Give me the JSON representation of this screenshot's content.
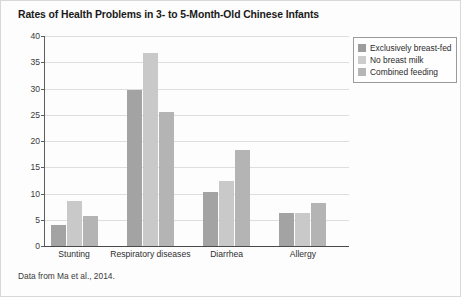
{
  "figure": {
    "title": "Rates of Health Problems in 3- to 5-Month-Old Chinese Infants",
    "source_note": "Data from Ma et al., 2014."
  },
  "chart_data": {
    "type": "bar",
    "title": "Rates of Health Problems in 3- to 5-Month-Old Chinese Infants",
    "xlabel": "",
    "ylabel": "",
    "ylim": [
      0,
      40
    ],
    "ytick_labels": [
      "0",
      "5",
      "10",
      "15",
      "20",
      "25",
      "30",
      "35",
      "40"
    ],
    "ytick_values": [
      0,
      5,
      10,
      15,
      20,
      25,
      30,
      35,
      40
    ],
    "grid": "horizontal",
    "legend_position": "top-right",
    "categories": [
      "Stunting",
      "Respiratory diseases",
      "Diarrhea",
      "Allergy"
    ],
    "series": [
      {
        "name": "Exclusively breast-fed",
        "color": "#a3a3a3",
        "values": [
          4.0,
          29.7,
          10.3,
          6.2
        ]
      },
      {
        "name": "No breast milk",
        "color": "#c9c9c9",
        "values": [
          8.5,
          36.8,
          12.4,
          6.3
        ]
      },
      {
        "name": "Combined feeding",
        "color": "#b4b4b4",
        "values": [
          5.7,
          25.5,
          18.2,
          8.1
        ]
      }
    ]
  }
}
